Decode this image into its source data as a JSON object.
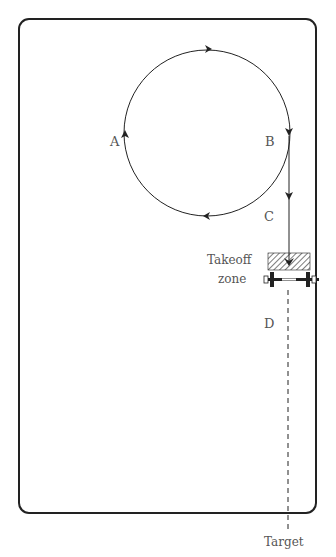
{
  "diagram": {
    "type": "flight-path",
    "labels": {
      "a": "A",
      "b": "B",
      "c": "C",
      "d": "D",
      "takeoff_line1": "Takeoff",
      "takeoff_line2": "zone",
      "target": "Target"
    },
    "colors": {
      "stroke": "#222222",
      "text": "#555555",
      "background": "#ffffff"
    }
  }
}
